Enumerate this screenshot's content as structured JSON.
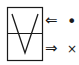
{
  "diagram": {
    "top_arrow": "⇐",
    "top_symbol": "•",
    "bottom_arrow": "⇒",
    "bottom_symbol": "×",
    "stroke_color": "#1a1a1a"
  }
}
